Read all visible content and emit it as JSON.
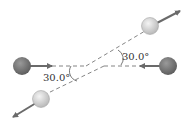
{
  "diagram": {
    "type": "two-dimensional elastic collision",
    "angles": {
      "upper_right": {
        "label": "30.0°",
        "value_deg": 30.0
      },
      "lower_left": {
        "label": "30.0°",
        "value_deg": 30.0
      }
    },
    "objects": [
      {
        "name": "incoming-ball-left",
        "state": "before collision",
        "direction": "right"
      },
      {
        "name": "incoming-ball-right",
        "state": "before collision",
        "direction": "left"
      },
      {
        "name": "outgoing-ball-upper-right",
        "state": "after collision",
        "direction": "up-right"
      },
      {
        "name": "outgoing-ball-lower-left",
        "state": "after collision",
        "direction": "down-left"
      }
    ],
    "colors": {
      "incoming_ball": "#7a7a7a",
      "outgoing_ball": "#d8d8d8",
      "arrow": "#6a6a6a",
      "dashed_line": "#777777"
    }
  }
}
